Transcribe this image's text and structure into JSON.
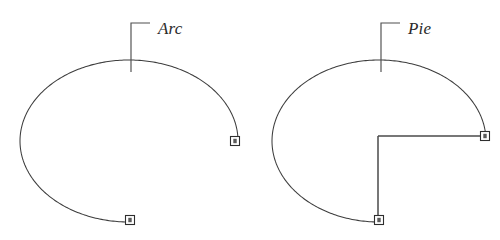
{
  "figure": {
    "background_color": "#ffffff",
    "line_color": "#3d3d3d",
    "grip_fill_color": "#ffffff",
    "grip_stroke_color": "#2e2e2e",
    "label_color": "#2b2b2b",
    "width": 500,
    "height": 240
  },
  "objects": [
    {
      "id": "arc",
      "label": "Arc",
      "label_x": 158,
      "label_y": 34,
      "leader": {
        "horizontal_start_x": 131,
        "horizontal_end_x": 150,
        "horizontal_y": 23,
        "vertical_x": 131,
        "vertical_top_y": 23,
        "vertical_bottom_y": 72
      },
      "ellipse": {
        "center_x": 129,
        "center_y": 141,
        "radius_x": 109,
        "radius_y": 81
      },
      "grips": [
        {
          "name": "arc-endpoint-start",
          "x": 235,
          "y": 141
        },
        {
          "name": "arc-endpoint-end",
          "x": 130,
          "y": 220
        }
      ],
      "radius_lines": []
    },
    {
      "id": "pie",
      "label": "Pie",
      "label_x": 408,
      "label_y": 34,
      "leader": {
        "horizontal_start_x": 381,
        "horizontal_end_x": 400,
        "horizontal_y": 23,
        "vertical_x": 381,
        "vertical_top_y": 23,
        "vertical_bottom_y": 72
      },
      "ellipse": {
        "center_x": 379,
        "center_y": 141,
        "radius_x": 107,
        "radius_y": 81
      },
      "grips": [
        {
          "name": "pie-endpoint-start",
          "x": 485,
          "y": 136
        },
        {
          "name": "pie-endpoint-end",
          "x": 379,
          "y": 220
        }
      ],
      "radius_lines": [
        {
          "name": "pie-radius-horizontal",
          "x1": 378,
          "y1": 136,
          "x2": 485,
          "y2": 136
        },
        {
          "name": "pie-radius-vertical",
          "x1": 378,
          "y1": 136,
          "x2": 378,
          "y2": 220
        }
      ]
    }
  ]
}
